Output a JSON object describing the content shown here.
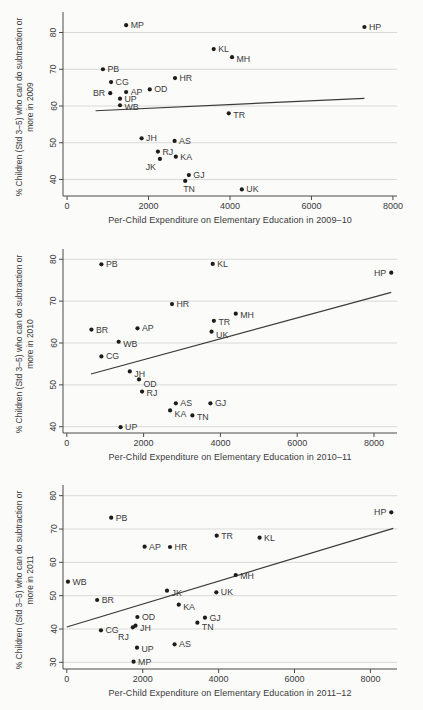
{
  "colors": {
    "background": "#fbfbfa",
    "point": "#1c1c1c",
    "fit_line": "#3a3a3a",
    "grid": "#d9d9d6",
    "axis": "#4a4a4a",
    "text": "#3a3a3a"
  },
  "chart_data": [
    {
      "type": "scatter",
      "title": "",
      "xlabel": "Per-Child Expenditure on Elementary Education in 2009–10",
      "ylabel": "% Children (Std 3–5) who can do subtraction or more in 2009",
      "xlim": [
        -100,
        8100
      ],
      "ylim": [
        35.5,
        84.5
      ],
      "xticks": [
        0,
        2000,
        4000,
        6000,
        8000
      ],
      "yticks": [
        40,
        50,
        60,
        70,
        80
      ],
      "grid": true,
      "fit_line": {
        "x1": 700,
        "y1": 58.7,
        "x2": 7300,
        "y2": 62.1
      },
      "points": [
        {
          "s": "MP",
          "x": 1450,
          "y": 82
        },
        {
          "s": "HP",
          "x": 7300,
          "y": 81.5
        },
        {
          "s": "KL",
          "x": 3600,
          "y": 75.5
        },
        {
          "s": "MH",
          "x": 4050,
          "y": 73.3,
          "dy": 5
        },
        {
          "s": "PB",
          "x": 880,
          "y": 70
        },
        {
          "s": "HR",
          "x": 2650,
          "y": 67.6
        },
        {
          "s": "CG",
          "x": 1080,
          "y": 66.5
        },
        {
          "s": "OD",
          "x": 2030,
          "y": 64.5
        },
        {
          "s": "AP",
          "x": 1450,
          "y": 63.8
        },
        {
          "s": "BR",
          "x": 1060,
          "y": 63.5,
          "a": "end",
          "dx": -5
        },
        {
          "s": "UP",
          "x": 1300,
          "y": 62
        },
        {
          "s": "WB",
          "x": 1300,
          "y": 60.2,
          "dy": 5
        },
        {
          "s": "TR",
          "x": 3970,
          "y": 58,
          "dy": 5
        },
        {
          "s": "JH",
          "x": 1830,
          "y": 51.2
        },
        {
          "s": "AS",
          "x": 2640,
          "y": 50.5
        },
        {
          "s": "RJ",
          "x": 2230,
          "y": 47.6
        },
        {
          "s": "KA",
          "x": 2670,
          "y": 46.2
        },
        {
          "s": "JK",
          "x": 2280,
          "y": 45.6,
          "a": "end",
          "dx": -4,
          "dy": 11
        },
        {
          "s": "GJ",
          "x": 2990,
          "y": 41.2
        },
        {
          "s": "TN",
          "x": 2900,
          "y": 39.6,
          "dx": -2,
          "dy": 11
        },
        {
          "s": "UK",
          "x": 4290,
          "y": 37.3
        }
      ]
    },
    {
      "type": "scatter",
      "title": "",
      "xlabel": "Per-Child Expenditure on Elementary Education in 2010–11",
      "ylabel": "% Children (Std 3–5) who can do subtraction or more in 2010",
      "xlim": [
        -100,
        8600
      ],
      "ylim": [
        38.5,
        81.5
      ],
      "xticks": [
        0,
        2000,
        4000,
        6000,
        8000
      ],
      "yticks": [
        40,
        50,
        60,
        70,
        80
      ],
      "grid": true,
      "fit_line": {
        "x1": 630,
        "y1": 52.6,
        "x2": 8450,
        "y2": 72.1
      },
      "points": [
        {
          "s": "PB",
          "x": 900,
          "y": 78.8
        },
        {
          "s": "KL",
          "x": 3800,
          "y": 78.9
        },
        {
          "s": "HP",
          "x": 8450,
          "y": 76.8,
          "a": "end",
          "dx": -5
        },
        {
          "s": "HR",
          "x": 2740,
          "y": 69.3
        },
        {
          "s": "MH",
          "x": 4400,
          "y": 67,
          "dy": 4
        },
        {
          "s": "TR",
          "x": 3830,
          "y": 65.3,
          "dy": 4
        },
        {
          "s": "UK",
          "x": 3770,
          "y": 62.7,
          "dy": 6
        },
        {
          "s": "AP",
          "x": 1840,
          "y": 63.5
        },
        {
          "s": "BR",
          "x": 640,
          "y": 63.2
        },
        {
          "s": "WB",
          "x": 1350,
          "y": 60.3,
          "dy": 5
        },
        {
          "s": "CG",
          "x": 900,
          "y": 56.8
        },
        {
          "s": "JH",
          "x": 1640,
          "y": 53.2,
          "dy": 6
        },
        {
          "s": "OD",
          "x": 1880,
          "y": 51.3,
          "dy": 8
        },
        {
          "s": "RJ",
          "x": 1960,
          "y": 48.4,
          "dy": 4
        },
        {
          "s": "AS",
          "x": 2840,
          "y": 45.6
        },
        {
          "s": "GJ",
          "x": 3740,
          "y": 45.6
        },
        {
          "s": "KA",
          "x": 2690,
          "y": 43.9,
          "dy": 7
        },
        {
          "s": "TN",
          "x": 3270,
          "y": 42.7,
          "dy": 5
        },
        {
          "s": "UP",
          "x": 1400,
          "y": 39.9
        }
      ]
    },
    {
      "type": "scatter",
      "title": "",
      "xlabel": "Per-Child Expenditure on Elementary Education in 2011–12",
      "ylabel": "% Children (Std 3–5) who can do subtraction or more in 2011",
      "xlim": [
        -100,
        8700
      ],
      "ylim": [
        28,
        82
      ],
      "xticks": [
        0,
        2000,
        4000,
        6000,
        8000
      ],
      "yticks": [
        30,
        40,
        50,
        60,
        70,
        80
      ],
      "grid": true,
      "fit_line": {
        "x1": 0,
        "y1": 40.6,
        "x2": 8600,
        "y2": 70.2
      },
      "points": [
        {
          "s": "HP",
          "x": 8550,
          "y": 75,
          "a": "end",
          "dx": -5
        },
        {
          "s": "PB",
          "x": 1170,
          "y": 73.4
        },
        {
          "s": "TR",
          "x": 3950,
          "y": 68
        },
        {
          "s": "KL",
          "x": 5080,
          "y": 67.4
        },
        {
          "s": "AP",
          "x": 2050,
          "y": 64.7
        },
        {
          "s": "HR",
          "x": 2720,
          "y": 64.6
        },
        {
          "s": "MH",
          "x": 4450,
          "y": 56.2,
          "dy": 4
        },
        {
          "s": "WB",
          "x": 30,
          "y": 54.2
        },
        {
          "s": "JK",
          "x": 2640,
          "y": 51.5,
          "dy": 5
        },
        {
          "s": "UK",
          "x": 3940,
          "y": 51
        },
        {
          "s": "BR",
          "x": 800,
          "y": 48.7
        },
        {
          "s": "KA",
          "x": 2950,
          "y": 47.3,
          "dy": 5
        },
        {
          "s": "OD",
          "x": 1860,
          "y": 43.6
        },
        {
          "s": "GJ",
          "x": 3640,
          "y": 43.4
        },
        {
          "s": "TN",
          "x": 3440,
          "y": 41.9,
          "dy": 7
        },
        {
          "s": "JH",
          "x": 1810,
          "y": 41.0,
          "dy": 5
        },
        {
          "s": "RJ",
          "x": 1740,
          "y": 40.5,
          "a": "end",
          "dx": -4,
          "dy": 13
        },
        {
          "s": "CG",
          "x": 900,
          "y": 39.6
        },
        {
          "s": "UP",
          "x": 1850,
          "y": 34.4,
          "dy": 4
        },
        {
          "s": "AS",
          "x": 2840,
          "y": 35.4
        },
        {
          "s": "MP",
          "x": 1760,
          "y": 30.2
        }
      ]
    }
  ]
}
